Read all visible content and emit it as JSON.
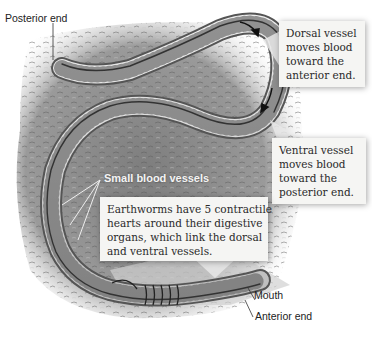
{
  "figure": {
    "labels": {
      "posterior_end": "Posterior end",
      "small_blood_vessels": "Small blood vessels",
      "mouth": "Mouth",
      "anterior_end": "Anterior end"
    },
    "callouts": {
      "dorsal": {
        "lines": [
          "Dorsal vessel",
          "moves blood",
          "toward the",
          "anterior end."
        ]
      },
      "ventral": {
        "lines": [
          "Ventral vessel",
          "moves blood",
          "toward the",
          "posterior end."
        ]
      },
      "hearts": {
        "lines": [
          "Earthworms have 5 contractile",
          "hearts around their digestive",
          "organs, which link the dorsal",
          "and ventral vessels."
        ]
      }
    },
    "colors": {
      "background": "#ffffff",
      "soil": "#8e8e8e",
      "worm_body": "#d9d9d9",
      "vessel": "#444444",
      "callout_bg": "#f5f5f3"
    }
  }
}
